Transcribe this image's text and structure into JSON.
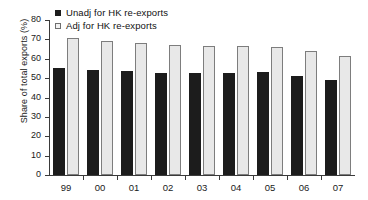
{
  "chart_data": {
    "type": "bar",
    "title": "",
    "xlabel": "",
    "ylabel": "Share of total exports (%)",
    "categories": [
      "99",
      "00",
      "01",
      "02",
      "03",
      "04",
      "05",
      "06",
      "07"
    ],
    "series": [
      {
        "name": "Unadj for HK re-exports",
        "color": "#1c1c1c",
        "values": [
          55.3,
          54.2,
          53.9,
          52.6,
          52.5,
          52.5,
          53.0,
          50.9,
          49.2
        ]
      },
      {
        "name": "Adj for HK re-exports",
        "color": "#e8e8e8",
        "values": [
          70.5,
          69.0,
          68.3,
          67.3,
          66.7,
          66.6,
          66.2,
          64.0,
          61.6
        ]
      }
    ],
    "ylim": [
      0,
      80
    ],
    "yticks": [
      0,
      10,
      20,
      30,
      40,
      50,
      60,
      70,
      80
    ],
    "ytick_labels": [
      "0",
      "10",
      "20",
      "30",
      "40",
      "50",
      "60",
      "70",
      "80"
    ],
    "grid": false,
    "legend_position": "top-left"
  },
  "legend": {
    "items": [
      {
        "label": "Unadj for HK re-exports",
        "marker": "filled-square"
      },
      {
        "label": "Adj for HK re-exports",
        "marker": "open-square"
      }
    ]
  }
}
